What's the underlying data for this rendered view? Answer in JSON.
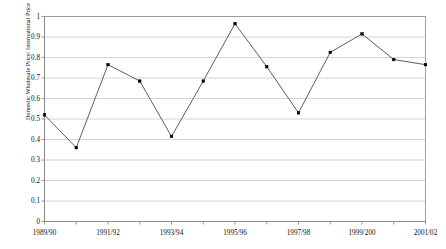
{
  "chart_data": {
    "type": "line",
    "title": "",
    "xlabel": "",
    "ylabel": "Domestic Wholesale Price/ International Price",
    "ylim": [
      0,
      1
    ],
    "ytick_labels": [
      "1",
      "0.9",
      "0.8",
      "0.7",
      "0.6",
      "0.5",
      "0.4",
      "0.3",
      "0.2",
      "0.1",
      "0"
    ],
    "ytick_values": [
      1,
      0.9,
      0.8,
      0.7,
      0.6,
      0.5,
      0.4,
      0.3,
      0.2,
      0.1,
      0
    ],
    "xtick_labels": [
      "1989/90",
      "1991/92",
      "1993/94",
      "1995/96",
      "1997/98",
      "1999/200",
      "2001/02"
    ],
    "xtick_indices": [
      0,
      2,
      4,
      6,
      8,
      10,
      12
    ],
    "categories": [
      "1989/90",
      "1990/91",
      "1991/92",
      "1992/93",
      "1993/94",
      "1994/95",
      "1995/96",
      "1996/97",
      "1997/98",
      "1998/99",
      "1999/200",
      "2000/01",
      "2001/02"
    ],
    "values": [
      0.52,
      0.36,
      0.765,
      0.685,
      0.415,
      0.685,
      0.965,
      0.755,
      0.53,
      0.825,
      0.915,
      0.79,
      0.765
    ],
    "grid": "horizontal",
    "legend": "none",
    "marker": "square",
    "line_color": "#555555",
    "marker_color": "#000000",
    "grid_color": "#c9c9c9",
    "border_color": "#9a9a9a"
  }
}
